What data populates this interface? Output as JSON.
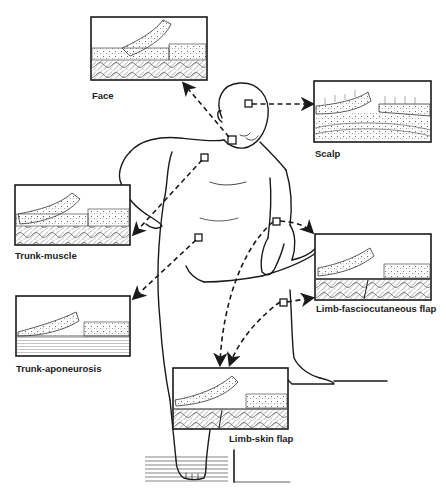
{
  "figure": {
    "panels": [
      {
        "id": "face",
        "label": "Face"
      },
      {
        "id": "scalp",
        "label": "Scalp"
      },
      {
        "id": "trunk-muscle",
        "label": "Trunk-muscle"
      },
      {
        "id": "trunk-aponeurosis",
        "label": "Trunk-aponeurosis"
      },
      {
        "id": "limb-fasciocutaneous",
        "label": "Limb-fasciocutaneous flap"
      },
      {
        "id": "limb-skin",
        "label": "Limb-skin flap"
      }
    ]
  },
  "colors": {
    "ink": "#1a1a1a",
    "hatch": "#777777",
    "background": "#ffffff"
  }
}
